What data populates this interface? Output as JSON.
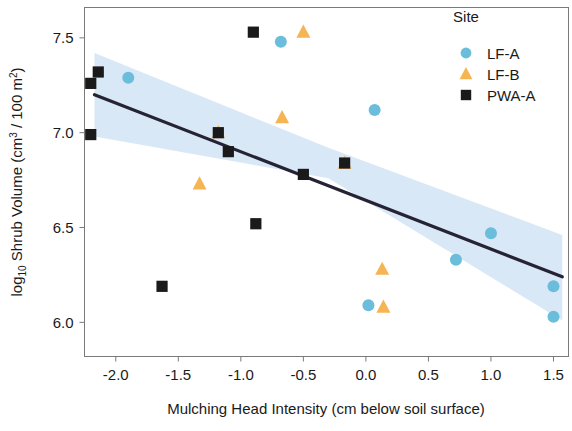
{
  "chart_data": {
    "type": "scatter",
    "title": "",
    "xlabel": "Mulching Head Intensity (cm below soil surface)",
    "ylabel": "log10 Shrub Volume (cm3 / 100 m2)",
    "ylabel_parts": {
      "prefix": "log",
      "sub1": "10",
      "mid": " Shrub Volume (cm",
      "sup1": "3",
      "mid2": " / 100 m",
      "sup2": "2",
      "suffix": ")"
    },
    "xlim": [
      -2.25,
      1.62
    ],
    "ylim": [
      5.82,
      7.66
    ],
    "xticks": [
      -2.0,
      -1.5,
      -1.0,
      -0.5,
      0.0,
      0.5,
      1.0,
      1.5
    ],
    "xtick_labels": [
      "-2.0",
      "-1.5",
      "-1.0",
      "-0.5",
      "0.0",
      "0.5",
      "1.0",
      "1.5"
    ],
    "yticks": [
      6.0,
      6.5,
      7.0,
      7.5
    ],
    "ytick_labels": [
      "6.0",
      "6.5",
      "7.0",
      "7.5"
    ],
    "grid": false,
    "legend": {
      "title": "Site",
      "position": "top-right",
      "entries": [
        {
          "name": "LF-A",
          "marker": "circle",
          "color": "#6ABDDB"
        },
        {
          "name": "LF-B",
          "marker": "triangle",
          "color": "#F5B553"
        },
        {
          "name": "PWA-A",
          "marker": "square",
          "color": "#1A1A1A"
        }
      ]
    },
    "series": [
      {
        "name": "LF-A",
        "marker": "circle",
        "color": "#6ABDDB",
        "points": [
          {
            "x": -1.9,
            "y": 7.29
          },
          {
            "x": -0.68,
            "y": 7.48
          },
          {
            "x": 0.07,
            "y": 7.12
          },
          {
            "x": 0.72,
            "y": 6.33
          },
          {
            "x": 1.0,
            "y": 6.47
          },
          {
            "x": 1.5,
            "y": 6.19
          },
          {
            "x": 1.5,
            "y": 6.03
          },
          {
            "x": 0.02,
            "y": 6.09
          }
        ]
      },
      {
        "name": "LF-B",
        "marker": "triangle",
        "color": "#F5B553",
        "points": [
          {
            "x": -1.33,
            "y": 6.73
          },
          {
            "x": -1.18,
            "y": 7.0
          },
          {
            "x": -0.67,
            "y": 7.08
          },
          {
            "x": -0.5,
            "y": 7.53
          },
          {
            "x": -0.17,
            "y": 6.84
          },
          {
            "x": 0.13,
            "y": 6.28
          },
          {
            "x": 0.14,
            "y": 6.08
          }
        ]
      },
      {
        "name": "PWA-A",
        "marker": "square",
        "color": "#1A1A1A",
        "points": [
          {
            "x": -2.2,
            "y": 7.26
          },
          {
            "x": -2.14,
            "y": 7.32
          },
          {
            "x": -2.2,
            "y": 6.99
          },
          {
            "x": -1.63,
            "y": 6.19
          },
          {
            "x": -1.18,
            "y": 7.0
          },
          {
            "x": -1.1,
            "y": 6.9
          },
          {
            "x": -0.9,
            "y": 7.53
          },
          {
            "x": -0.88,
            "y": 6.52
          },
          {
            "x": -0.5,
            "y": 6.78
          },
          {
            "x": -0.17,
            "y": 6.84
          }
        ]
      }
    ],
    "fit_line": {
      "label": "linear regression",
      "color": "#262335",
      "x_start": -2.17,
      "y_start": 7.2,
      "x_end": 1.57,
      "y_end": 6.24
    },
    "confidence_band": {
      "label": "95% confidence interval",
      "color": "#D6E7F5",
      "upper": [
        {
          "x": -2.17,
          "y": 7.42
        },
        {
          "x": -0.3,
          "y": 6.92
        },
        {
          "x": 1.57,
          "y": 6.46
        }
      ],
      "lower": [
        {
          "x": -2.17,
          "y": 6.98
        },
        {
          "x": -0.3,
          "y": 6.76
        },
        {
          "x": 1.57,
          "y": 6.01
        }
      ]
    }
  }
}
